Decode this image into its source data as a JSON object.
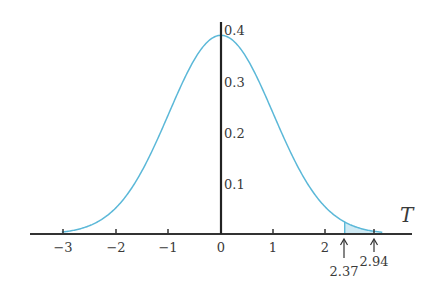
{
  "chart_data": {
    "type": "line",
    "title": "",
    "subtitle": "",
    "xlabel": "T",
    "ylabel": "",
    "xlim": [
      -3.5,
      3.6
    ],
    "ylim": [
      0,
      0.4
    ],
    "grid": false,
    "legend": null,
    "x_ticks": [
      -3,
      -2,
      -1,
      0,
      1,
      2
    ],
    "x_tick_labels": [
      "−3",
      "−2",
      "−1",
      "0",
      "1",
      "2"
    ],
    "y_ticks": [
      0.1,
      0.2,
      0.3,
      0.4
    ],
    "y_tick_labels": [
      "0.1",
      "0.2",
      "0.3",
      "0.4"
    ],
    "series": [
      {
        "name": "density",
        "color": "#5bb8d8",
        "x": [
          -3.0,
          -2.5,
          -2.0,
          -1.5,
          -1.0,
          -0.5,
          0.0,
          0.5,
          1.0,
          1.5,
          2.0,
          2.37,
          2.5,
          2.94,
          3.0
        ],
        "values": [
          0.004,
          0.018,
          0.054,
          0.13,
          0.242,
          0.352,
          0.399,
          0.352,
          0.242,
          0.13,
          0.054,
          0.024,
          0.018,
          0.005,
          0.004
        ]
      }
    ],
    "shaded_region": {
      "from": 2.37,
      "to": 2.94,
      "color": "#cfeaf4"
    },
    "annotations": [
      {
        "x": 2.37,
        "label": "2.37",
        "marker": "up-arrow"
      },
      {
        "x": 2.94,
        "label": "2.94",
        "marker": "up-arrow"
      }
    ]
  },
  "labels": {
    "axis_t": "T",
    "x0": "0",
    "ann1": "2.37",
    "ann2": "2.94",
    "y1": "0.1",
    "y2": "0.2",
    "y3": "0.3",
    "y4": "0.4",
    "xm3": "−3",
    "xm2": "−2",
    "xm1": "−1",
    "x1": "1",
    "x2": "2"
  },
  "colors": {
    "curve": "#5bb8d8",
    "shade": "#cfeaf4",
    "axis": "#333333"
  }
}
